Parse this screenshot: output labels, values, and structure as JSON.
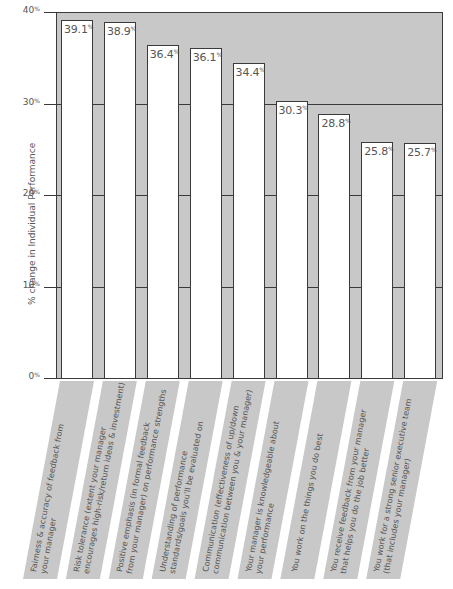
{
  "chart_data": {
    "type": "bar",
    "title": "",
    "xlabel": "",
    "ylabel": "% change in Individual Performance",
    "ylim": [
      0,
      40
    ],
    "yticks": [
      "0%",
      "10%",
      "20%",
      "30%",
      "40%"
    ],
    "grid": true,
    "legend": null,
    "categories": [
      "Fairness & accuracy of feedback from your manager",
      "Risk tolerance (extent your manager encourages high-risk/return ideas & investment)",
      "Positive emphasis (in formal feedback from your manager) on performance strengths",
      "Understanding of performance standards/goals you'll be evaluated on",
      "Communication (effectiveness of up/down communication between you & your manager)",
      "Your manager is knowledgeable about your performance",
      "You work on the things you do best",
      "You receive feedback from your manager that helps you do the job better",
      "You work for a strong senior executive team (that includes your manager)"
    ],
    "category_lines": [
      [
        "Fairness & accuracy of feedback from",
        "your manager"
      ],
      [
        "Risk tolerance (extent your manager",
        "encourages high-risk/return ideas & investment)"
      ],
      [
        "Positive emphasis (in formal feedback",
        "from your manager) on performance strengths"
      ],
      [
        "Understanding of performance",
        "standards/goals you'll be evaluated on"
      ],
      [
        "Communication (effectiveness of up/down",
        "communication between you & your manager)"
      ],
      [
        "Your manager is knowledgeable about",
        "your performance"
      ],
      [
        "You work on the things you do best"
      ],
      [
        "You receive feedback from your manager",
        "that helps you do the job better"
      ],
      [
        "You work for a strong senior executive team",
        "(that includes your manager)"
      ]
    ],
    "values": [
      39.1,
      38.9,
      36.4,
      36.1,
      34.4,
      30.3,
      28.8,
      25.8,
      25.7
    ],
    "value_labels": [
      "39.1",
      "38.9",
      "36.4",
      "36.1",
      "34.4",
      "30.3",
      "28.8",
      "25.8",
      "25.7"
    ],
    "value_suffix": "%",
    "colors": {
      "plot_background": "#c8c8c8",
      "bar_fill": "#ffffff",
      "outline": "#3a3a3a",
      "label_band": "#c8c8c8",
      "text": "#555555"
    }
  }
}
